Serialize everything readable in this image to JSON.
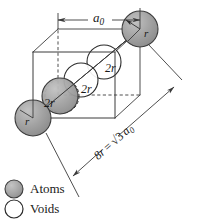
{
  "figure": {
    "type": "bcc-unit-cell-diagram",
    "background_color": "#ffffff"
  },
  "colors": {
    "atom_fill": "#9a9a9a",
    "atom_fill_light": "#b4b4b4",
    "atom_stroke": "#3c3c3c",
    "void_fill": "#ffffff",
    "void_stroke": "#2b2b2b",
    "line": "#3a3a3a",
    "dash": "#3a3a3a",
    "text": "#1a1a1a"
  },
  "labels": {
    "cell_edge": "a",
    "cell_edge_sub": "0",
    "atom_radius_top": "r",
    "atom_radius_bottom": "r",
    "diameter_1": "2r",
    "diameter_2": "2r",
    "diameter_3": "2r",
    "diagonal_relation_lhs": "8r",
    "diagonal_relation_eq": "=",
    "diagonal_relation_root": "√3",
    "diagonal_relation_rhs": "a",
    "diagonal_relation_rhs_sub": "0"
  },
  "legend": {
    "items": [
      {
        "symbol": "filled-circle",
        "label": "Atoms",
        "fill": "#9a9a9a",
        "stroke": "#3c3c3c"
      },
      {
        "symbol": "open-circle",
        "label": "Voids",
        "fill": "#ffffff",
        "stroke": "#2b2b2b"
      }
    ]
  },
  "geometry": {
    "cube": {
      "front_top_left": [
        33,
        52
      ],
      "front_top_right": [
        115,
        52
      ],
      "front_bottom_left": [
        33,
        118
      ],
      "front_bottom_right": [
        115,
        118
      ],
      "back_top_left": [
        58,
        29
      ],
      "back_top_right": [
        140,
        29
      ],
      "back_bottom_left": [
        58,
        95
      ],
      "back_bottom_right": [
        140,
        95
      ]
    },
    "atoms": [
      {
        "name": "corner-atom-top-right",
        "cx": 140,
        "cy": 29,
        "r": 18
      },
      {
        "name": "corner-atom-bottom-left",
        "cx": 33,
        "cy": 118,
        "r": 18
      },
      {
        "name": "interior-atom",
        "cx": 60,
        "cy": 96,
        "r": 18
      }
    ],
    "voids": [
      {
        "name": "void-upper",
        "cx": 104,
        "cy": 62,
        "r": 17
      },
      {
        "name": "void-middle",
        "cx": 81,
        "cy": 80,
        "r": 17
      },
      {
        "name": "void-lower-dashed",
        "cx": 62,
        "cy": 96,
        "r": 17
      }
    ],
    "body_diagonal": {
      "from": [
        33,
        118
      ],
      "to": [
        140,
        29
      ]
    },
    "dimension_line_a0": {
      "from": [
        58,
        20
      ],
      "to": [
        140,
        20
      ]
    },
    "dimension_line_diagonal": {
      "from": [
        75,
        185
      ],
      "to": [
        175,
        88
      ]
    }
  }
}
